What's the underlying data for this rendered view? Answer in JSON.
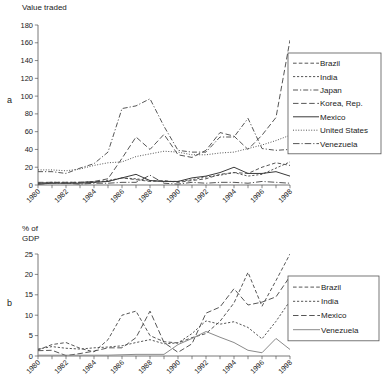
{
  "figure": {
    "panels": [
      {
        "letter": "a",
        "axis_title": "Value traded"
      },
      {
        "letter": "b",
        "axis_title": "% of\nGDP"
      }
    ]
  },
  "chart_data": [
    {
      "id": "panel-a",
      "type": "line",
      "title": "Value traded",
      "panel_label": "a",
      "xlabel": "",
      "ylabel": "Value traded",
      "grid": false,
      "legend_position": "right",
      "xlim": [
        1980,
        1998
      ],
      "ylim": [
        0,
        180
      ],
      "yticks": [
        0,
        20,
        40,
        60,
        80,
        100,
        120,
        140,
        160,
        180
      ],
      "xticks": [
        1980,
        1981,
        1982,
        1983,
        1984,
        1985,
        1986,
        1987,
        1988,
        1989,
        1990,
        1991,
        1992,
        1993,
        1994,
        1995,
        1996,
        1997,
        1998
      ],
      "xtick_labels": [
        "1980",
        "",
        "1982",
        "",
        "1984",
        "",
        "1986",
        "",
        "1988",
        "",
        "1990",
        "",
        "1992",
        "",
        "1994",
        "",
        "1996",
        "",
        "1998"
      ],
      "x": [
        1980,
        1981,
        1982,
        1983,
        1984,
        1985,
        1986,
        1987,
        1988,
        1989,
        1990,
        1991,
        1992,
        1993,
        1994,
        1995,
        1996,
        1997,
        1998
      ],
      "series": [
        {
          "name": "Brazil",
          "style": "dashed",
          "color": "#4d4d4d",
          "values": [
            2,
            3,
            2,
            3,
            4,
            4,
            8,
            6,
            4,
            5,
            3,
            5,
            7,
            12,
            14,
            13,
            20,
            25,
            22
          ]
        },
        {
          "name": "India",
          "style": "fine-dashed",
          "color": "#4d4d4d",
          "values": [
            2,
            3,
            3,
            3,
            3,
            5,
            8,
            7,
            5,
            4,
            4,
            6,
            9,
            11,
            14,
            10,
            12,
            19,
            26
          ]
        },
        {
          "name": "Japan",
          "style": "dash-dot",
          "color": "#4d4d4d",
          "values": [
            15,
            15,
            13,
            19,
            24,
            37,
            86,
            89,
            97,
            66,
            39,
            37,
            37,
            54,
            54,
            75,
            41,
            39,
            40
          ]
        },
        {
          "name": "Korea, Rep.",
          "style": "long-dashed",
          "color": "#4d4d4d",
          "values": [
            3,
            3,
            3,
            3,
            4,
            7,
            30,
            54,
            40,
            57,
            34,
            31,
            39,
            59,
            55,
            40,
            56,
            76,
            163
          ]
        },
        {
          "name": "Mexico",
          "style": "solid",
          "color": "#3a3a3a",
          "values": [
            1,
            2,
            2,
            2,
            3,
            4,
            8,
            12,
            5,
            4,
            4,
            8,
            10,
            14,
            20,
            13,
            13,
            15,
            10
          ]
        },
        {
          "name": "United States",
          "style": "dotted",
          "color": "#4d4d4d",
          "values": [
            17,
            17,
            16,
            18,
            22,
            25,
            26,
            32,
            35,
            38,
            37,
            34,
            34,
            36,
            37,
            41,
            45,
            50,
            56
          ]
        },
        {
          "name": "Venezuela",
          "style": "dash-dot-long",
          "color": "#4d4d4d",
          "values": [
            1,
            2,
            2,
            1,
            2,
            2,
            3,
            3,
            11,
            2,
            1,
            3,
            2,
            3,
            3,
            2,
            4,
            3,
            2
          ]
        }
      ]
    },
    {
      "id": "panel-b",
      "type": "line",
      "title": "% of GDP",
      "panel_label": "b",
      "xlabel": "",
      "ylabel": "% of GDP",
      "grid": false,
      "legend_position": "right",
      "xlim": [
        1980,
        1998
      ],
      "ylim": [
        0,
        25
      ],
      "yticks": [
        0,
        5,
        10,
        15,
        20,
        25
      ],
      "xticks": [
        1980,
        1981,
        1982,
        1983,
        1984,
        1985,
        1986,
        1987,
        1988,
        1989,
        1990,
        1991,
        1992,
        1993,
        1994,
        1995,
        1996,
        1997,
        1998
      ],
      "xtick_labels": [
        "1980",
        "",
        "1982",
        "",
        "1984",
        "",
        "1986",
        "",
        "1988",
        "",
        "1990",
        "",
        "1992",
        "",
        "1994",
        "",
        "1996",
        "",
        "1998"
      ],
      "x": [
        1980,
        1981,
        1982,
        1983,
        1984,
        1985,
        1986,
        1987,
        1988,
        1989,
        1990,
        1991,
        1992,
        1993,
        1994,
        1995,
        1996,
        1997,
        1998
      ],
      "series": [
        {
          "name": "Brazil",
          "style": "dashed",
          "color": "#4d4d4d",
          "values": [
            1.5,
            2.8,
            3.3,
            1.9,
            1.0,
            4.0,
            10.0,
            11.0,
            5.0,
            3.5,
            3.2,
            4.5,
            5.5,
            8.5,
            13.0,
            20.5,
            12.2,
            18.5,
            25.0
          ]
        },
        {
          "name": "India",
          "style": "fine-dashed",
          "color": "#4d4d4d",
          "values": [
            1.7,
            2.3,
            1.9,
            1.7,
            2.0,
            2.2,
            2.5,
            3.3,
            4.0,
            3.0,
            3.2,
            5.5,
            8.6,
            7.8,
            8.4,
            7.0,
            4.2,
            8.5,
            13.5
          ]
        },
        {
          "name": "Mexico",
          "style": "long-dashed",
          "color": "#4d4d4d",
          "values": [
            1.3,
            1.4,
            0.1,
            0.6,
            1.2,
            2.0,
            2.0,
            4.5,
            11.0,
            3.3,
            0.9,
            3.0,
            10.5,
            12.0,
            16.5,
            12.5,
            13.2,
            14.5,
            19.5
          ]
        },
        {
          "name": "Venezuela",
          "style": "solid",
          "color": "#8a8a8a",
          "values": [
            0.2,
            0.2,
            0.2,
            0.2,
            0.2,
            0.2,
            0.3,
            0.4,
            0.4,
            0.4,
            2.8,
            4.3,
            6.0,
            4.6,
            3.3,
            1.4,
            0.8,
            4.3,
            1.6
          ]
        }
      ]
    }
  ]
}
